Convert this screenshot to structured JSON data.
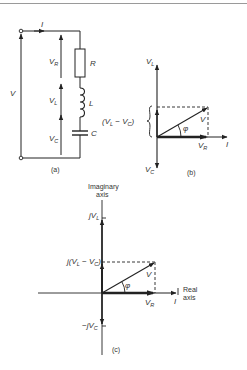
{
  "figure": {
    "panel_a": {
      "caption": "(a)",
      "current_label": "I",
      "source_voltage_label": "V",
      "components": [
        {
          "name": "R",
          "drop_label": "V",
          "drop_sub": "R"
        },
        {
          "name": "L",
          "drop_label": "V",
          "drop_sub": "L"
        },
        {
          "name": "C",
          "drop_label": "V",
          "drop_sub": "C"
        }
      ]
    },
    "panel_b": {
      "caption": "(b)",
      "vl_label": "V",
      "vl_sub": "L",
      "vc_label": "V",
      "vc_sub": "C",
      "diff_label_open": "(V",
      "diff_sub1": "L",
      "diff_mid": " − V",
      "diff_sub2": "C",
      "diff_close": ")",
      "v_label": "V",
      "vr_label": "V",
      "vr_sub": "R",
      "i_label": "I",
      "phi_label": "φ"
    },
    "panel_c": {
      "caption": "(c)",
      "imag_axis_label_line1": "Imaginary",
      "imag_axis_label_line2": "axis",
      "real_axis_label_line1": "Real",
      "real_axis_label_line2": "axis",
      "jvl_label": "jV",
      "jvl_sub": "L",
      "jdiff_open": "j(V",
      "jdiff_sub1": "L",
      "jdiff_mid": " − V",
      "jdiff_sub2": "C",
      "jdiff_close": ")",
      "neg_jvc_label": "−jV",
      "neg_jvc_sub": "C",
      "v_label": "V",
      "vr_label": "V",
      "vr_sub": "R",
      "i_label": "I",
      "phi_label": "φ"
    }
  }
}
